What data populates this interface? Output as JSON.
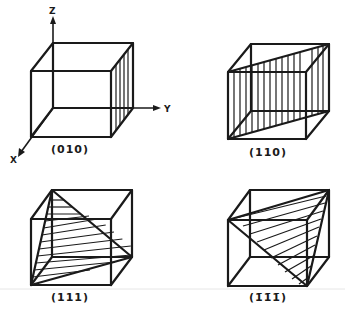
{
  "figure": {
    "axes": {
      "z": "Z",
      "y": "Y",
      "x": "X"
    },
    "panels": [
      {
        "id": "p010",
        "label": "(010)",
        "plane": "face parallel to XZ at y=1, vertical hatching"
      },
      {
        "id": "p110",
        "label": "(110)",
        "plane": "diagonal vertical plane, vertical hatching"
      },
      {
        "id": "p111",
        "label": "(111)",
        "plane": "triangular section, diagonal hatching"
      },
      {
        "id": "pm111",
        "label": "(1̄1̄1̄)",
        "plane": "triangular section (negative indices), diagonal hatching"
      }
    ]
  }
}
